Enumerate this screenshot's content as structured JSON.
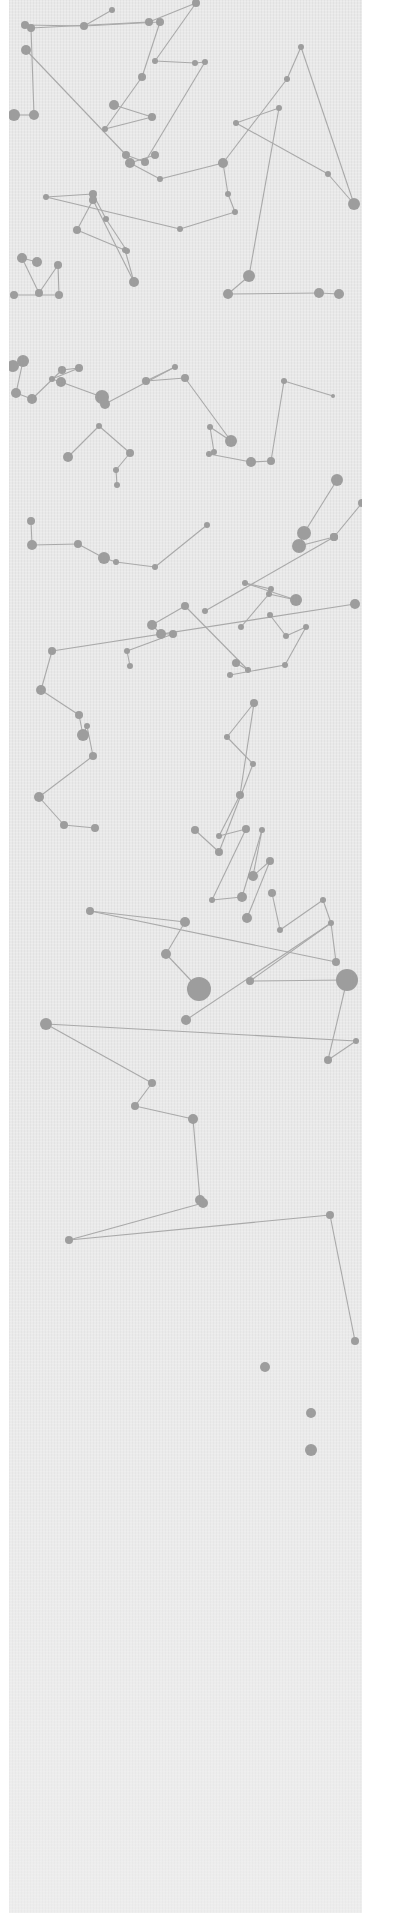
{
  "image": {
    "description": "Decorative network / constellation pattern: gray nodes connected by thin lines on a light gray linen-textured background, fading to plain texture at the bottom, with a white margin on the right",
    "colors": {
      "background": "#ffffff",
      "panel": "#e9e9e9",
      "node": "#9d9d9d",
      "edge": "#a9a9a9"
    }
  },
  "network": {
    "nodes": [
      [
        16,
        25,
        4
      ],
      [
        22,
        28,
        4
      ],
      [
        17,
        50,
        5
      ],
      [
        75,
        26,
        4
      ],
      [
        103,
        10,
        3
      ],
      [
        140,
        22,
        4
      ],
      [
        187,
        3,
        4
      ],
      [
        146,
        61,
        3
      ],
      [
        151,
        22,
        4
      ],
      [
        25,
        115,
        5
      ],
      [
        5,
        115,
        6
      ],
      [
        133,
        77,
        4
      ],
      [
        186,
        63,
        3
      ],
      [
        196,
        62,
        3
      ],
      [
        105,
        105,
        5
      ],
      [
        143,
        117,
        4
      ],
      [
        96,
        129,
        3
      ],
      [
        117,
        155,
        4
      ],
      [
        136,
        162,
        4
      ],
      [
        146,
        155,
        4
      ],
      [
        121,
        163,
        5
      ],
      [
        151,
        179,
        3
      ],
      [
        214,
        163,
        5
      ],
      [
        278,
        79,
        3
      ],
      [
        292,
        47,
        3
      ],
      [
        270,
        108,
        3
      ],
      [
        227,
        123,
        3
      ],
      [
        319,
        174,
        3
      ],
      [
        345,
        204,
        6
      ],
      [
        219,
        194,
        3
      ],
      [
        226,
        212,
        3
      ],
      [
        171,
        229,
        3
      ],
      [
        37,
        197,
        3
      ],
      [
        84,
        194,
        4
      ],
      [
        97,
        219,
        3
      ],
      [
        118,
        251,
        3
      ],
      [
        68,
        230,
        4
      ],
      [
        84,
        200,
        4
      ],
      [
        125,
        282,
        5
      ],
      [
        116,
        250,
        3
      ],
      [
        28,
        262,
        5
      ],
      [
        13,
        258,
        5
      ],
      [
        30,
        293,
        4
      ],
      [
        49,
        265,
        4
      ],
      [
        50,
        295,
        4
      ],
      [
        5,
        295,
        4
      ],
      [
        240,
        276,
        6
      ],
      [
        219,
        294,
        5
      ],
      [
        310,
        293,
        5
      ],
      [
        330,
        294,
        5
      ],
      [
        4,
        366,
        6
      ],
      [
        14,
        361,
        6
      ],
      [
        7,
        393,
        5
      ],
      [
        23,
        399,
        5
      ],
      [
        53,
        370,
        4
      ],
      [
        70,
        368,
        4
      ],
      [
        43,
        379,
        3
      ],
      [
        52,
        382,
        5
      ],
      [
        93,
        397,
        7
      ],
      [
        96,
        404,
        5
      ],
      [
        166,
        367,
        3
      ],
      [
        137,
        381,
        4
      ],
      [
        176,
        378,
        4
      ],
      [
        222,
        441,
        6
      ],
      [
        201,
        427,
        3
      ],
      [
        205,
        452,
        3
      ],
      [
        200,
        454,
        3
      ],
      [
        242,
        462,
        5
      ],
      [
        262,
        461,
        4
      ],
      [
        275,
        381,
        3
      ],
      [
        324,
        396,
        2
      ],
      [
        59,
        457,
        5
      ],
      [
        90,
        426,
        3
      ],
      [
        121,
        453,
        4
      ],
      [
        107,
        470,
        3
      ],
      [
        108,
        485,
        3
      ],
      [
        328,
        480,
        6
      ],
      [
        295,
        533,
        7
      ],
      [
        290,
        546,
        7
      ],
      [
        325,
        537,
        4
      ],
      [
        353,
        503,
        4
      ],
      [
        22,
        521,
        4
      ],
      [
        23,
        545,
        5
      ],
      [
        69,
        544,
        4
      ],
      [
        95,
        558,
        6
      ],
      [
        107,
        562,
        3
      ],
      [
        146,
        567,
        3
      ],
      [
        198,
        525,
        3
      ],
      [
        232,
        627,
        3
      ],
      [
        260,
        594,
        3
      ],
      [
        287,
        600,
        6
      ],
      [
        236,
        583,
        3
      ],
      [
        262,
        589,
        3
      ],
      [
        196,
        611,
        3
      ],
      [
        325,
        537,
        4
      ],
      [
        227,
        663,
        4
      ],
      [
        239,
        670,
        3
      ],
      [
        176,
        606,
        4
      ],
      [
        143,
        625,
        5
      ],
      [
        152,
        634,
        5
      ],
      [
        164,
        634,
        4
      ],
      [
        118,
        651,
        3
      ],
      [
        121,
        666,
        3
      ],
      [
        261,
        615,
        3
      ],
      [
        277,
        636,
        3
      ],
      [
        297,
        627,
        3
      ],
      [
        276,
        665,
        3
      ],
      [
        221,
        675,
        3
      ],
      [
        346,
        604,
        5
      ],
      [
        43,
        651,
        4
      ],
      [
        32,
        690,
        5
      ],
      [
        70,
        715,
        4
      ],
      [
        74,
        735,
        6
      ],
      [
        78,
        726,
        3
      ],
      [
        84,
        756,
        4
      ],
      [
        30,
        797,
        5
      ],
      [
        55,
        825,
        4
      ],
      [
        86,
        828,
        4
      ],
      [
        186,
        830,
        4
      ],
      [
        210,
        852,
        4
      ],
      [
        244,
        764,
        3
      ],
      [
        218,
        737,
        3
      ],
      [
        245,
        703,
        4
      ],
      [
        231,
        795,
        4
      ],
      [
        210,
        836,
        3
      ],
      [
        237,
        829,
        4
      ],
      [
        203,
        900,
        3
      ],
      [
        233,
        897,
        5
      ],
      [
        253,
        830,
        3
      ],
      [
        244,
        876,
        5
      ],
      [
        261,
        861,
        4
      ],
      [
        238,
        918,
        5
      ],
      [
        263,
        893,
        4
      ],
      [
        271,
        930,
        3
      ],
      [
        314,
        900,
        3
      ],
      [
        322,
        923,
        3
      ],
      [
        327,
        962,
        4
      ],
      [
        81,
        911,
        4
      ],
      [
        176,
        922,
        5
      ],
      [
        157,
        954,
        5
      ],
      [
        190,
        989,
        12
      ],
      [
        177,
        1020,
        5
      ],
      [
        241,
        981,
        4
      ],
      [
        338,
        980,
        11
      ],
      [
        319,
        1060,
        4
      ],
      [
        347,
        1041,
        3
      ],
      [
        37,
        1024,
        6
      ],
      [
        143,
        1083,
        4
      ],
      [
        126,
        1106,
        4
      ],
      [
        184,
        1119,
        5
      ],
      [
        191,
        1200,
        5
      ],
      [
        194,
        1203,
        5
      ],
      [
        60,
        1240,
        4
      ],
      [
        321,
        1215,
        4
      ],
      [
        346,
        1341,
        4
      ],
      [
        256,
        1367,
        5
      ],
      [
        302,
        1413,
        5
      ],
      [
        302,
        1450,
        6
      ]
    ],
    "edges": [
      [
        0,
        3
      ],
      [
        3,
        4
      ],
      [
        3,
        8
      ],
      [
        8,
        11
      ],
      [
        11,
        16
      ],
      [
        16,
        15
      ],
      [
        15,
        14
      ],
      [
        5,
        1
      ],
      [
        1,
        9
      ],
      [
        9,
        10
      ],
      [
        2,
        17
      ],
      [
        17,
        18
      ],
      [
        18,
        13
      ],
      [
        13,
        12
      ],
      [
        12,
        7
      ],
      [
        7,
        6
      ],
      [
        6,
        5
      ],
      [
        19,
        20
      ],
      [
        20,
        21
      ],
      [
        21,
        22
      ],
      [
        22,
        23
      ],
      [
        23,
        24
      ],
      [
        24,
        28
      ],
      [
        25,
        26
      ],
      [
        26,
        27
      ],
      [
        27,
        28
      ],
      [
        22,
        29
      ],
      [
        29,
        30
      ],
      [
        30,
        31
      ],
      [
        31,
        32
      ],
      [
        32,
        33
      ],
      [
        33,
        34
      ],
      [
        34,
        35
      ],
      [
        35,
        36
      ],
      [
        36,
        37
      ],
      [
        37,
        38
      ],
      [
        38,
        39
      ],
      [
        40,
        41
      ],
      [
        41,
        42
      ],
      [
        42,
        43
      ],
      [
        43,
        44
      ],
      [
        44,
        45
      ],
      [
        46,
        47
      ],
      [
        47,
        48
      ],
      [
        48,
        49
      ],
      [
        46,
        25
      ],
      [
        50,
        51
      ],
      [
        51,
        52
      ],
      [
        52,
        53
      ],
      [
        53,
        54
      ],
      [
        54,
        55
      ],
      [
        55,
        56
      ],
      [
        56,
        57
      ],
      [
        57,
        58
      ],
      [
        58,
        59
      ],
      [
        59,
        60
      ],
      [
        60,
        61
      ],
      [
        61,
        62
      ],
      [
        62,
        63
      ],
      [
        63,
        64
      ],
      [
        64,
        65
      ],
      [
        65,
        66
      ],
      [
        66,
        67
      ],
      [
        67,
        68
      ],
      [
        68,
        69
      ],
      [
        69,
        70
      ],
      [
        71,
        72
      ],
      [
        72,
        73
      ],
      [
        73,
        74
      ],
      [
        74,
        75
      ],
      [
        76,
        77
      ],
      [
        77,
        78
      ],
      [
        78,
        79
      ],
      [
        79,
        80
      ],
      [
        81,
        82
      ],
      [
        82,
        83
      ],
      [
        83,
        84
      ],
      [
        84,
        85
      ],
      [
        85,
        86
      ],
      [
        86,
        87
      ],
      [
        88,
        89
      ],
      [
        89,
        90
      ],
      [
        90,
        91
      ],
      [
        91,
        92
      ],
      [
        93,
        94
      ],
      [
        95,
        96
      ],
      [
        96,
        97
      ],
      [
        97,
        98
      ],
      [
        98,
        99
      ],
      [
        99,
        100
      ],
      [
        100,
        101
      ],
      [
        101,
        102
      ],
      [
        103,
        104
      ],
      [
        104,
        105
      ],
      [
        105,
        106
      ],
      [
        106,
        107
      ],
      [
        108,
        109
      ],
      [
        109,
        110
      ],
      [
        110,
        111
      ],
      [
        111,
        112
      ],
      [
        112,
        113
      ],
      [
        113,
        114
      ],
      [
        114,
        115
      ],
      [
        115,
        116
      ],
      [
        116,
        117
      ],
      [
        118,
        119
      ],
      [
        119,
        120
      ],
      [
        120,
        121
      ],
      [
        121,
        122
      ],
      [
        122,
        123
      ],
      [
        123,
        124
      ],
      [
        124,
        125
      ],
      [
        125,
        126
      ],
      [
        126,
        127
      ],
      [
        127,
        128
      ],
      [
        128,
        129
      ],
      [
        129,
        130
      ],
      [
        130,
        131
      ],
      [
        132,
        133
      ],
      [
        133,
        134
      ],
      [
        134,
        135
      ],
      [
        135,
        136
      ],
      [
        136,
        137
      ],
      [
        137,
        138
      ],
      [
        138,
        139
      ],
      [
        139,
        140
      ],
      [
        141,
        135
      ],
      [
        135,
        142
      ],
      [
        142,
        143
      ],
      [
        143,
        144
      ],
      [
        144,
        145
      ],
      [
        145,
        146
      ],
      [
        146,
        147
      ],
      [
        147,
        148
      ],
      [
        148,
        149
      ],
      [
        149,
        150
      ],
      [
        150,
        151
      ],
      [
        151,
        152
      ],
      [
        152,
        153
      ],
      [
        153,
        154
      ]
    ]
  }
}
